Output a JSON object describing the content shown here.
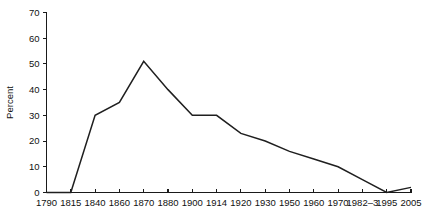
{
  "chart_data": {
    "type": "line",
    "title": "",
    "subtitle": "",
    "xlabel": "",
    "ylabel": "Percent",
    "x": [
      "1790",
      "1815",
      "1840",
      "1860",
      "1870",
      "1880",
      "1900",
      "1914",
      "1920",
      "1930",
      "1950",
      "1960",
      "1970",
      "1982–3",
      "1995",
      "2005"
    ],
    "values": [
      0,
      0,
      30,
      35,
      51,
      40,
      30,
      30,
      23,
      20,
      16,
      13,
      10,
      5,
      0,
      2
    ],
    "xtick_labels": [
      "1790",
      "1815",
      "1840",
      "1860",
      "1870",
      "1880",
      "1900",
      "1914",
      "1920",
      "1930",
      "1950",
      "1960",
      "1970",
      "1982–3",
      "1995",
      "2005"
    ],
    "ytick_labels": [
      "0",
      "10",
      "20",
      "30",
      "40",
      "50",
      "60",
      "70"
    ],
    "ytick_values": [
      0,
      10,
      20,
      30,
      40,
      50,
      60,
      70
    ],
    "ylim": [
      0,
      70
    ],
    "grid": false,
    "legend": false,
    "legend_position": "none",
    "line_color": "#1f1f1f",
    "axis_color": "#1a1a1a",
    "background_color": "#ffffff",
    "annotations": []
  }
}
